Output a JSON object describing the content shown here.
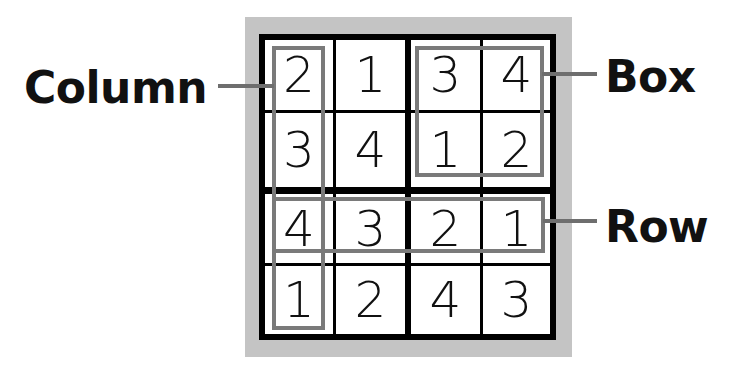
{
  "labels": {
    "column": "Column",
    "box": "Box",
    "row": "Row"
  },
  "grid": {
    "rows": [
      [
        "2",
        "1",
        "3",
        "4"
      ],
      [
        "3",
        "4",
        "1",
        "2"
      ],
      [
        "4",
        "3",
        "2",
        "1"
      ],
      [
        "1",
        "2",
        "4",
        "3"
      ]
    ]
  },
  "colors": {
    "frame": "#c4c4c4",
    "grid_lines": "#000000",
    "highlight": "#7a7a7a",
    "text": "#111111"
  }
}
